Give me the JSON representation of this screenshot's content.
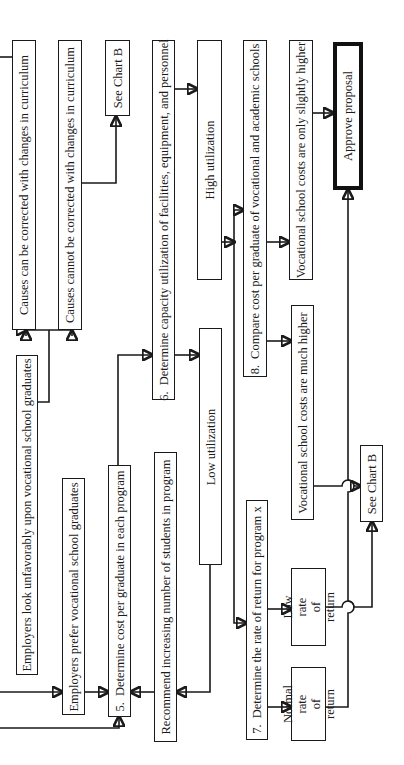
{
  "diagram": {
    "orientation": "rotated 90 degrees counter-clockwise",
    "nodes": {
      "causes_can": {
        "text": "Causes can be corrected with changes in curriculum"
      },
      "causes_cannot": {
        "text": "Causes cannot be corrected with changes in curriculum"
      },
      "see_chart_b_top": {
        "text": "See Chart B"
      },
      "step6": {
        "number": "6.",
        "text": "Determine capacity utilization of facilities, equipment, and personnel"
      },
      "high_util": {
        "text": "High utilization"
      },
      "step8": {
        "number": "8.",
        "text": "Compare cost per graduate of vocational and academic schools"
      },
      "costs_slightly_higher": {
        "text": "Vocational school costs are only slightly higher"
      },
      "approve": {
        "text": "Approve proposal"
      },
      "employers_unfavorable": {
        "text": "Employers look unfavorably upon vocational school graduates"
      },
      "employers_prefer": {
        "text": "Employers prefer vocational school graduates"
      },
      "step5": {
        "number": "5.",
        "text": "Determine cost per graduate in each program"
      },
      "recommend": {
        "text": "Recommend increasing number of students in program"
      },
      "low_util": {
        "text": "Low utilization"
      },
      "costs_much_higher": {
        "text": "Vocational school costs are much higher"
      },
      "see_chart_b_bottom": {
        "text": "See Chart B"
      },
      "step7": {
        "number": "7.",
        "text": "Determine the rate of return for program x"
      },
      "low_return": {
        "line1": "Low rate",
        "line2": "of return"
      },
      "normal_return": {
        "line1": "Normal rate",
        "line2": "of return"
      }
    }
  }
}
